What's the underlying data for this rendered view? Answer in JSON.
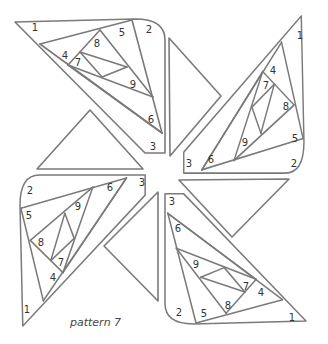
{
  "caption": "pattern 7",
  "colors": {
    "line": "#7a7a7a",
    "text": "#333333",
    "background": "#ffffff"
  },
  "pieces": [
    {
      "id": "top-left",
      "labels": [
        {
          "n": "1",
          "x": 35,
          "y": 28
        },
        {
          "n": "2",
          "x": 149,
          "y": 30
        },
        {
          "n": "3",
          "x": 153,
          "y": 147
        },
        {
          "n": "4",
          "x": 65,
          "y": 56
        },
        {
          "n": "5",
          "x": 122,
          "y": 33
        },
        {
          "n": "6",
          "x": 151,
          "y": 120
        },
        {
          "n": "7",
          "x": 78,
          "y": 63
        },
        {
          "n": "8",
          "x": 97,
          "y": 44
        },
        {
          "n": "9",
          "x": 133,
          "y": 85
        }
      ]
    },
    {
      "id": "top-right",
      "labels": [
        {
          "n": "1",
          "x": 300,
          "y": 36
        },
        {
          "n": "2",
          "x": 294,
          "y": 164
        },
        {
          "n": "3",
          "x": 189,
          "y": 164
        },
        {
          "n": "4",
          "x": 273,
          "y": 71
        },
        {
          "n": "5",
          "x": 295,
          "y": 139
        },
        {
          "n": "6",
          "x": 211,
          "y": 160
        },
        {
          "n": "7",
          "x": 266,
          "y": 86
        },
        {
          "n": "8",
          "x": 286,
          "y": 107
        },
        {
          "n": "9",
          "x": 245,
          "y": 143
        }
      ]
    },
    {
      "id": "bottom-left",
      "labels": [
        {
          "n": "1",
          "x": 27,
          "y": 310
        },
        {
          "n": "2",
          "x": 30,
          "y": 191
        },
        {
          "n": "3",
          "x": 142,
          "y": 183
        },
        {
          "n": "4",
          "x": 53,
          "y": 278
        },
        {
          "n": "5",
          "x": 29,
          "y": 216
        },
        {
          "n": "6",
          "x": 110,
          "y": 188
        },
        {
          "n": "7",
          "x": 61,
          "y": 263
        },
        {
          "n": "8",
          "x": 41,
          "y": 243
        },
        {
          "n": "9",
          "x": 78,
          "y": 207
        }
      ]
    },
    {
      "id": "bottom-right",
      "labels": [
        {
          "n": "1",
          "x": 292,
          "y": 318
        },
        {
          "n": "2",
          "x": 179,
          "y": 313
        },
        {
          "n": "3",
          "x": 172,
          "y": 202
        },
        {
          "n": "4",
          "x": 261,
          "y": 293
        },
        {
          "n": "5",
          "x": 204,
          "y": 314
        },
        {
          "n": "6",
          "x": 178,
          "y": 229
        },
        {
          "n": "7",
          "x": 246,
          "y": 287
        },
        {
          "n": "8",
          "x": 228,
          "y": 306
        },
        {
          "n": "9",
          "x": 196,
          "y": 265
        }
      ]
    }
  ],
  "triangles": [
    {
      "id": "triangle-under-top-left",
      "points": "37,169 90,110 143,169"
    },
    {
      "id": "triangle-right-of-top-left",
      "points": "169,38 221,96 170,156"
    },
    {
      "id": "triangle-under-top-right",
      "points": "179,180 289,179 232,237"
    },
    {
      "id": "triangle-left-of-bottom-right",
      "points": "158,192 104,246 158,301"
    }
  ]
}
